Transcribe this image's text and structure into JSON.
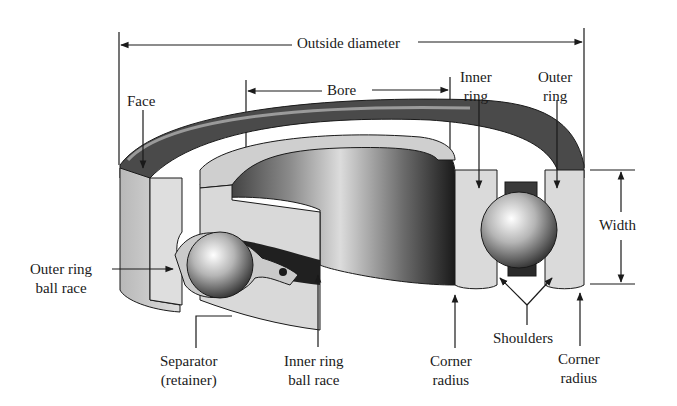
{
  "diagram": {
    "labels": {
      "outside_diameter": "Outside diameter",
      "bore": "Bore",
      "face": "Face",
      "inner_ring": [
        "Inner",
        "ring"
      ],
      "outer_ring": [
        "Outer",
        "ring"
      ],
      "width": "Width",
      "outer_ring_ball_race": [
        "Outer ring",
        "ball race"
      ],
      "separator": [
        "Separator",
        "(retainer)"
      ],
      "inner_ring_ball_race": [
        "Inner ring",
        "ball race"
      ],
      "corner_radius_left": [
        "Corner",
        "radius"
      ],
      "shoulders": "Shoulders",
      "corner_radius_right": [
        "Corner",
        "radius"
      ]
    },
    "colors": {
      "background": "#ffffff",
      "line": "#1a1a1a",
      "ring_light": "#d6d6d6",
      "ring_mid": "#9a9a9a",
      "ring_dark": "#2a2a2a"
    }
  }
}
